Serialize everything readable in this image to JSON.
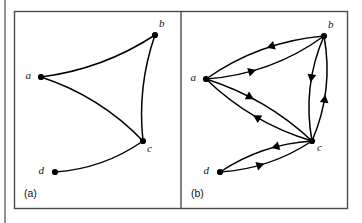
{
  "figure": {
    "background_color": "#ffffff",
    "line_color": "#000000",
    "frame_color": "#4a4a4a",
    "node_color": "#000000"
  },
  "panels": [
    {
      "id": "a",
      "label": "(a)",
      "caption_kind": "undirected-graph",
      "nodes": [
        {
          "id": "a",
          "label": "a",
          "x": 41,
          "y": 77,
          "label_dx": -10,
          "label_dy": 2
        },
        {
          "id": "b",
          "label": "b",
          "x": 155,
          "y": 35,
          "label_dx": 4,
          "label_dy": -8
        },
        {
          "id": "c",
          "label": "c",
          "x": 143,
          "y": 141,
          "label_dx": 4,
          "label_dy": 11
        },
        {
          "id": "d",
          "label": "d",
          "x": 55,
          "y": 172,
          "label_dx": -11,
          "label_dy": 2
        }
      ],
      "edges": [
        {
          "from": "a",
          "to": "b",
          "directed": false,
          "bow": 14
        },
        {
          "from": "a",
          "to": "c",
          "directed": false,
          "bow": -15
        },
        {
          "from": "b",
          "to": "c",
          "directed": false,
          "bow": 12
        },
        {
          "from": "d",
          "to": "c",
          "directed": false,
          "bow": 13
        }
      ]
    },
    {
      "id": "b",
      "label": "(b)",
      "caption_kind": "directed-graph",
      "nodes": [
        {
          "id": "a",
          "label": "a",
          "x": 206,
          "y": 79,
          "label_dx": -10,
          "label_dy": 2
        },
        {
          "id": "b",
          "label": "b",
          "x": 324,
          "y": 36,
          "label_dx": 4,
          "label_dy": -8
        },
        {
          "id": "c",
          "label": "c",
          "x": 312,
          "y": 141,
          "label_dx": 5,
          "label_dy": 10
        },
        {
          "id": "d",
          "label": "d",
          "x": 220,
          "y": 172,
          "label_dx": -11,
          "label_dy": 2
        }
      ],
      "edges": [
        {
          "from": "a",
          "to": "b",
          "directed": true,
          "bow": 18,
          "arrow_t": 0.4
        },
        {
          "from": "b",
          "to": "a",
          "directed": true,
          "bow": 17,
          "arrow_t": 0.46
        },
        {
          "from": "a",
          "to": "c",
          "directed": true,
          "bow": -14,
          "arrow_t": 0.42
        },
        {
          "from": "c",
          "to": "a",
          "directed": true,
          "bow": -15,
          "arrow_t": 0.52
        },
        {
          "from": "b",
          "to": "c",
          "directed": true,
          "bow": 16,
          "arrow_t": 0.45
        },
        {
          "from": "c",
          "to": "b",
          "directed": true,
          "bow": 16,
          "arrow_t": 0.45
        },
        {
          "from": "c",
          "to": "d",
          "directed": true,
          "bow": 13,
          "arrow_t": 0.42
        },
        {
          "from": "d",
          "to": "c",
          "directed": true,
          "bow": 13,
          "arrow_t": 0.46
        }
      ]
    }
  ],
  "frame": {
    "outer": {
      "x": 14,
      "y": 11,
      "width": 333,
      "height": 197
    },
    "divider_x": 181,
    "left_rule_x": 5,
    "left_rule_y0": 0,
    "left_rule_y1": 223
  }
}
